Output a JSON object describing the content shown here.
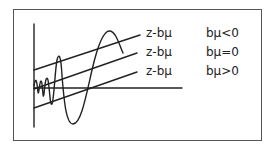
{
  "diagram": {
    "rows": [
      {
        "line_label": "z-bμ",
        "condition": "bμ<0"
      },
      {
        "line_label": "z-bμ",
        "condition": "bμ=0"
      },
      {
        "line_label": "z-bμ",
        "condition": "bμ>0"
      }
    ],
    "colors": {
      "stroke": "#222222",
      "frame": "#555555"
    }
  }
}
